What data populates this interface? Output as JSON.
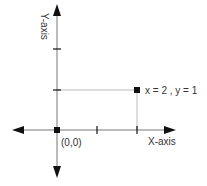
{
  "diagram": {
    "type": "coordinate-plane",
    "labels": {
      "y_axis": "Y-axis",
      "x_axis": "X-axis",
      "origin": "(0,0)",
      "point": "x = 2 , y = 1"
    },
    "point": {
      "x": 2,
      "y": 1
    },
    "origin": {
      "x": 0,
      "y": 0
    },
    "x_ticks": [
      1,
      2
    ],
    "y_ticks": [
      1,
      2
    ],
    "colors": {
      "axis": "#333333",
      "guide": "#bbbbbb",
      "marker": "#111111"
    }
  }
}
